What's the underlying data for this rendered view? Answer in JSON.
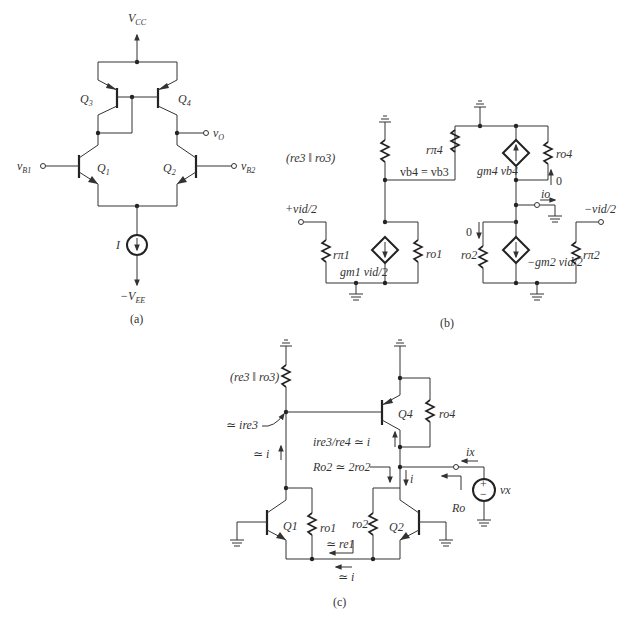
{
  "figure": {
    "panels": [
      {
        "id": "a",
        "caption": "(a)",
        "labels": {
          "vcc": "V",
          "vcc_sub": "CC",
          "vee": "−V",
          "vee_sub": "EE",
          "q1": "Q",
          "q1_sub": "1",
          "q2": "Q",
          "q2_sub": "2",
          "q3": "Q",
          "q3_sub": "3",
          "q4": "Q",
          "q4_sub": "4",
          "vb1": "v",
          "vb1_sub": "B1",
          "vb2": "v",
          "vb2_sub": "B2",
          "vo": "v",
          "vo_sub": "O",
          "current": "I"
        }
      },
      {
        "id": "b",
        "caption": "(b)",
        "labels": {
          "re3ro3": "(r",
          "re3ro3_full": "(re3 ‖ ro3)",
          "vb4": "v",
          "vb4_eq": "vb4 = vb3",
          "plus_vid": "+vid/2",
          "minus_vid": "−vid/2",
          "rpi1": "rπ1",
          "ro1": "ro1",
          "gm1": "gm1 vid/2",
          "rpi4": "rπ4",
          "ro4": "ro4",
          "gm4": "gm4 vb4",
          "io": "io",
          "zero_top": "0",
          "zero_left": "0",
          "ro2": "ro2",
          "gm2": "−gm2 vid/2",
          "rpi2": "rπ2"
        }
      },
      {
        "id": "c",
        "caption": "(c)",
        "labels": {
          "re3ro3_full": "(re3 ‖ ro3)",
          "approx_ire3": "≃ ire3",
          "approx_i": "≃ i",
          "q4": "Q4",
          "ro4": "ro4",
          "ire3_re4": "ire3/re4 ≃ i",
          "ro2_eq": "Ro2 ≃ 2ro2",
          "i": "i",
          "ix": "ix",
          "vx": "vx",
          "ro": "Ro",
          "q1": "Q1",
          "ro1": "ro1",
          "ro2": "ro2",
          "q2": "Q2",
          "approx_re1": "≃ re1",
          "approx_i_bottom": "≃ i",
          "plus": "+",
          "minus": "−"
        }
      }
    ]
  }
}
